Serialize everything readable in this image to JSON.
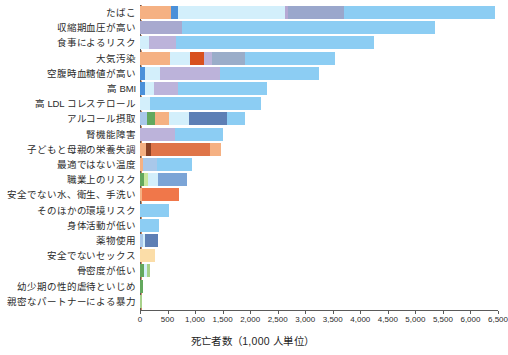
{
  "chart_data": {
    "type": "bar",
    "orientation": "horizontal",
    "stacked": true,
    "title": "",
    "xlabel": "死亡者数（1,000 人単位）",
    "ylabel": "",
    "xlim": [
      0,
      6500
    ],
    "grid": false,
    "legend": "none",
    "xticks": [
      "0",
      "500",
      "1,000",
      "1,500",
      "2,000",
      "2,500",
      "3,000",
      "3,500",
      "4,000",
      "4,500",
      "5,000",
      "5,500",
      "6,000",
      "6,500"
    ],
    "xtick_values": [
      0,
      500,
      1000,
      1500,
      2000,
      2500,
      3000,
      3500,
      4000,
      4500,
      5000,
      5500,
      6000,
      6500
    ],
    "categories": [
      "たばこ",
      "収縮期血圧が高い",
      "食事によるリスク",
      "大気汚染",
      "空腹時血糖値が高い",
      "高 BMI",
      "高 LDL コレステロール",
      "アルコール摂取",
      "腎機能障害",
      "子どもと母親の栄養失調",
      "最適ではない温度",
      "職業上のリスク",
      "安全でない水、衛生、手洗い",
      "そのほかの環境リスク",
      "身体活動が低い",
      "薬物使用",
      "安全でないセックス",
      "骨密度が低い",
      "幼少期の性的虐待といじめ",
      "親密なパートナーによる暴力"
    ],
    "totals": [
      6450,
      5350,
      4250,
      3550,
      3250,
      2300,
      2200,
      1900,
      1500,
      1480,
      950,
      860,
      700,
      520,
      340,
      320,
      270,
      180,
      55,
      45
    ],
    "series": [
      {
        "name": "たばこ",
        "segments": [
          {
            "value": 560,
            "color": "#f5b183"
          },
          {
            "value": 130,
            "color": "#4a90d9"
          },
          {
            "value": 1940,
            "color": "#d3effb"
          },
          {
            "value": 60,
            "color": "#b6a8d4"
          },
          {
            "value": 1010,
            "color": "#9aa7cc"
          },
          {
            "value": 2750,
            "color": "#8ccdf3"
          }
        ]
      },
      {
        "name": "収縮期血圧が高い",
        "segments": [
          {
            "value": 760,
            "color": "#a8a9cf"
          },
          {
            "value": 4590,
            "color": "#8ccdf3"
          }
        ]
      },
      {
        "name": "食事によるリスク",
        "segments": [
          {
            "value": 170,
            "color": "#d3effb"
          },
          {
            "value": 490,
            "color": "#bcb3da"
          },
          {
            "value": 3590,
            "color": "#8ccdf3"
          }
        ]
      },
      {
        "name": "大気汚染",
        "segments": [
          {
            "value": 540,
            "color": "#f5b183"
          },
          {
            "value": 360,
            "color": "#d3effb"
          },
          {
            "value": 270,
            "color": "#d8501e"
          },
          {
            "value": 130,
            "color": "#bcb3da"
          },
          {
            "value": 600,
            "color": "#9aadc9"
          },
          {
            "value": 1650,
            "color": "#8ccdf3"
          }
        ]
      },
      {
        "name": "空腹時血糖値が高い",
        "segments": [
          {
            "value": 90,
            "color": "#4a90d9"
          },
          {
            "value": 270,
            "color": "#d3effb"
          },
          {
            "value": 1100,
            "color": "#bcb3da"
          },
          {
            "value": 1790,
            "color": "#8ccdf3"
          }
        ]
      },
      {
        "name": "高 BMI",
        "segments": [
          {
            "value": 90,
            "color": "#4a90d9"
          },
          {
            "value": 170,
            "color": "#d3effb"
          },
          {
            "value": 430,
            "color": "#bcb3da"
          },
          {
            "value": 1610,
            "color": "#8ccdf3"
          }
        ]
      },
      {
        "name": "高 LDL コレステロール",
        "segments": [
          {
            "value": 180,
            "color": "#d3effb"
          },
          {
            "value": 2020,
            "color": "#8ccdf3"
          }
        ]
      },
      {
        "name": "アルコール摂取",
        "segments": [
          {
            "value": 130,
            "color": "#a9c8ea"
          },
          {
            "value": 150,
            "color": "#63a85e"
          },
          {
            "value": 240,
            "color": "#f5b183"
          },
          {
            "value": 370,
            "color": "#d3effb"
          },
          {
            "value": 690,
            "color": "#5d7fb5"
          },
          {
            "value": 320,
            "color": "#8ccdf3"
          }
        ]
      },
      {
        "name": "腎機能障害",
        "segments": [
          {
            "value": 640,
            "color": "#bcb3da"
          },
          {
            "value": 860,
            "color": "#8ccdf3"
          }
        ]
      },
      {
        "name": "子どもと母親の栄養失調",
        "segments": [
          {
            "value": 110,
            "color": "#f5b183"
          },
          {
            "value": 90,
            "color": "#8a4226"
          },
          {
            "value": 1080,
            "color": "#df7549"
          },
          {
            "value": 200,
            "color": "#f5b183"
          }
        ]
      },
      {
        "name": "最適ではない温度",
        "segments": [
          {
            "value": 60,
            "color": "#f5b183"
          },
          {
            "value": 250,
            "color": "#a9c8ea"
          },
          {
            "value": 640,
            "color": "#8ccdf3"
          }
        ]
      },
      {
        "name": "職業上のリスク",
        "segments": [
          {
            "value": 70,
            "color": "#63a85e"
          },
          {
            "value": 70,
            "color": "#c9e8a0"
          },
          {
            "value": 180,
            "color": "#d3effb"
          },
          {
            "value": 540,
            "color": "#7ba4d6"
          }
        ]
      },
      {
        "name": "安全でない水、衛生、手洗い",
        "segments": [
          {
            "value": 40,
            "color": "#f5b183"
          },
          {
            "value": 660,
            "color": "#f0774a"
          }
        ]
      },
      {
        "name": "そのほかの環境リスク",
        "segments": [
          {
            "value": 520,
            "color": "#8ccdf3"
          }
        ]
      },
      {
        "name": "身体活動が低い",
        "segments": [
          {
            "value": 340,
            "color": "#8ccdf3"
          }
        ]
      },
      {
        "name": "薬物使用",
        "segments": [
          {
            "value": 60,
            "color": "#a9c8ea"
          },
          {
            "value": 30,
            "color": "#d3effb"
          },
          {
            "value": 230,
            "color": "#5d7fb5"
          }
        ]
      },
      {
        "name": "安全でないセックス",
        "segments": [
          {
            "value": 270,
            "color": "#fbdda8"
          }
        ]
      },
      {
        "name": "骨密度が低い",
        "segments": [
          {
            "value": 80,
            "color": "#63a85e"
          },
          {
            "value": 40,
            "color": "#d3effb"
          },
          {
            "value": 60,
            "color": "#a7d18a"
          }
        ]
      },
      {
        "name": "幼少期の性的虐待といじめ",
        "segments": [
          {
            "value": 55,
            "color": "#63a85e"
          }
        ]
      },
      {
        "name": "親密なパートナーによる暴力",
        "segments": [
          {
            "value": 45,
            "color": "#a7d18a"
          }
        ]
      }
    ]
  },
  "axis": {
    "x_title": "死亡者数（1,000 人単位）"
  }
}
